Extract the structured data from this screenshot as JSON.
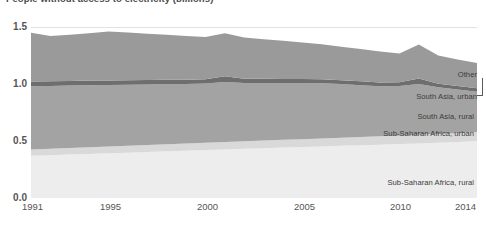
{
  "chart_title": "People without access to electricity (billions)",
  "axes": {
    "y_ticks": [
      "0.0",
      "0.5",
      "1.0",
      "1.5"
    ],
    "x_ticks": [
      "1991",
      "1995",
      "2000",
      "2005",
      "2010",
      "2014"
    ]
  },
  "annotations": {
    "other": "Other",
    "south_asia_urban": "South Asia, urban",
    "south_asia_rural": "South Asia, rural",
    "ssa_urban": "Sub-Saharan Africa, urban",
    "ssa_rural": "Sub-Saharan Africa, rural"
  },
  "colors": {
    "ssa_rural": "#ededed",
    "ssa_urban": "#d9d9d9",
    "south_asia_rural": "#a3a3a3",
    "south_asia_urban": "#6e6e6e",
    "other": "#9a9a9a",
    "gridline": "#e2e2e2",
    "text": "#555555"
  },
  "chart_data": {
    "type": "area",
    "title": "People without access to electricity (billions)",
    "xlabel": "",
    "ylabel": "",
    "stacked": true,
    "grid": true,
    "legend_position": "inline-annotations",
    "xlim": [
      1991,
      2014
    ],
    "ylim": [
      0.0,
      1.5
    ],
    "x": [
      1991,
      1992,
      1993,
      1994,
      1995,
      1996,
      1997,
      1998,
      1999,
      2000,
      2001,
      2002,
      2003,
      2004,
      2005,
      2006,
      2007,
      2008,
      2009,
      2010,
      2011,
      2012,
      2013,
      2014
    ],
    "series": [
      {
        "name": "Sub-Saharan Africa, rural",
        "values": [
          0.37,
          0.375,
          0.381,
          0.387,
          0.392,
          0.398,
          0.404,
          0.41,
          0.415,
          0.42,
          0.426,
          0.431,
          0.437,
          0.442,
          0.447,
          0.452,
          0.458,
          0.463,
          0.468,
          0.473,
          0.479,
          0.485,
          0.492,
          0.5
        ]
      },
      {
        "name": "Sub-Saharan Africa, urban",
        "values": [
          0.055,
          0.056,
          0.057,
          0.058,
          0.059,
          0.06,
          0.061,
          0.062,
          0.063,
          0.064,
          0.065,
          0.066,
          0.067,
          0.068,
          0.069,
          0.07,
          0.071,
          0.072,
          0.073,
          0.074,
          0.075,
          0.076,
          0.077,
          0.078
        ]
      },
      {
        "name": "South Asia, rural",
        "values": [
          0.555,
          0.552,
          0.548,
          0.545,
          0.54,
          0.536,
          0.531,
          0.527,
          0.522,
          0.52,
          0.526,
          0.512,
          0.505,
          0.498,
          0.492,
          0.484,
          0.47,
          0.455,
          0.44,
          0.435,
          0.447,
          0.41,
          0.382,
          0.355
        ]
      },
      {
        "name": "South Asia, urban",
        "values": [
          0.042,
          0.041,
          0.041,
          0.04,
          0.04,
          0.039,
          0.039,
          0.038,
          0.038,
          0.037,
          0.05,
          0.037,
          0.036,
          0.036,
          0.035,
          0.035,
          0.034,
          0.034,
          0.033,
          0.033,
          0.048,
          0.032,
          0.031,
          0.03
        ]
      },
      {
        "name": "Other",
        "values": [
          0.428,
          0.396,
          0.404,
          0.415,
          0.43,
          0.418,
          0.406,
          0.394,
          0.382,
          0.372,
          0.378,
          0.362,
          0.348,
          0.336,
          0.322,
          0.308,
          0.294,
          0.282,
          0.27,
          0.252,
          0.298,
          0.248,
          0.232,
          0.222
        ]
      }
    ],
    "totals": [
      1.45,
      1.42,
      1.431,
      1.445,
      1.461,
      1.451,
      1.441,
      1.431,
      1.42,
      1.413,
      1.445,
      1.408,
      1.393,
      1.38,
      1.365,
      1.349,
      1.327,
      1.306,
      1.284,
      1.267,
      1.347,
      1.251,
      1.214,
      1.185
    ]
  }
}
